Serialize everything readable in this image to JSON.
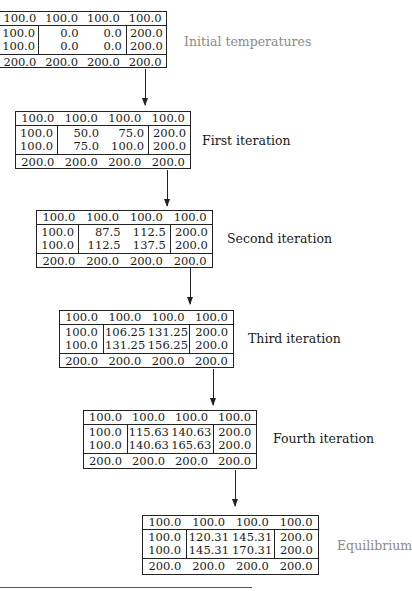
{
  "diagram": {
    "stages": [
      {
        "label": "Initial temperatures",
        "label_style": "light",
        "top": [
          "100.0",
          "100.0",
          "100.0",
          "100.0"
        ],
        "left": [
          "100.0",
          "100.0"
        ],
        "inner": [
          [
            "0.0",
            "0.0"
          ],
          [
            "0.0",
            "0.0"
          ]
        ],
        "right": [
          "200.0",
          "200.0"
        ],
        "bottom": [
          "200.0",
          "200.0",
          "200.0",
          "200.0"
        ]
      },
      {
        "label": "First iteration",
        "label_style": "dark",
        "top": [
          "100.0",
          "100.0",
          "100.0",
          "100.0"
        ],
        "left": [
          "100.0",
          "100.0"
        ],
        "inner": [
          [
            "50.0",
            "75.0"
          ],
          [
            "75.0",
            "100.0"
          ]
        ],
        "right": [
          "200.0",
          "200.0"
        ],
        "bottom": [
          "200.0",
          "200.0",
          "200.0",
          "200.0"
        ]
      },
      {
        "label": "Second iteration",
        "label_style": "dark",
        "top": [
          "100.0",
          "100.0",
          "100.0",
          "100.0"
        ],
        "left": [
          "100.0",
          "100.0"
        ],
        "inner": [
          [
            "87.5",
            "112.5"
          ],
          [
            "112.5",
            "137.5"
          ]
        ],
        "right": [
          "200.0",
          "200.0"
        ],
        "bottom": [
          "200.0",
          "200.0",
          "200.0",
          "200.0"
        ]
      },
      {
        "label": "Third iteration",
        "label_style": "dark",
        "top": [
          "100.0",
          "100.0",
          "100.0",
          "100.0"
        ],
        "left": [
          "100.0",
          "100.0"
        ],
        "inner": [
          [
            "106.25",
            "131.25"
          ],
          [
            "131.25",
            "156.25"
          ]
        ],
        "right": [
          "200.0",
          "200.0"
        ],
        "bottom": [
          "200.0",
          "200.0",
          "200.0",
          "200.0"
        ]
      },
      {
        "label": "Fourth iteration",
        "label_style": "dark",
        "top": [
          "100.0",
          "100.0",
          "100.0",
          "100.0"
        ],
        "left": [
          "100.0",
          "100.0"
        ],
        "inner": [
          [
            "115.63",
            "140.63"
          ],
          [
            "140.63",
            "165.63"
          ]
        ],
        "right": [
          "200.0",
          "200.0"
        ],
        "bottom": [
          "200.0",
          "200.0",
          "200.0",
          "200.0"
        ]
      },
      {
        "label": "Equilibrium",
        "label_style": "light",
        "top": [
          "100.0",
          "100.0",
          "100.0",
          "100.0"
        ],
        "left": [
          "100.0",
          "100.0"
        ],
        "inner": [
          [
            "120.31",
            "145.31"
          ],
          [
            "145.31",
            "170.31"
          ]
        ],
        "right": [
          "200.0",
          "200.0"
        ],
        "bottom": [
          "200.0",
          "200.0",
          "200.0",
          "200.0"
        ]
      }
    ],
    "colors": {
      "line": "#222222",
      "text": "#1a1a1a",
      "light_label": "#8a8a8a"
    }
  }
}
